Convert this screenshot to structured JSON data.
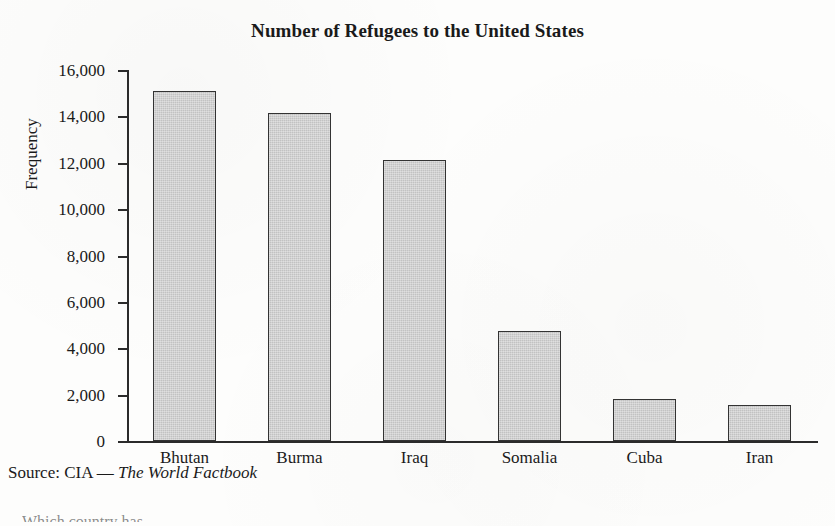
{
  "chart_data": {
    "type": "bar",
    "title": "Number of Refugees to the United States",
    "xlabel": "",
    "ylabel": "Frequency",
    "categories": [
      "Bhutan",
      "Burma",
      "Iraq",
      "Somalia",
      "Cuba",
      "Iran"
    ],
    "values": [
      15100,
      14150,
      12100,
      4750,
      1800,
      1550
    ],
    "ylim": [
      0,
      16000
    ],
    "ytick_values": [
      0,
      2000,
      4000,
      6000,
      8000,
      10000,
      12000,
      14000,
      16000
    ],
    "ytick_labels": [
      "0",
      "2,000",
      "4,000",
      "6,000",
      "8,000",
      "10,000",
      "12,000",
      "14,000",
      "16,000"
    ],
    "grid": false,
    "legend": "none",
    "bar_fill_color": "#c2c2c2",
    "bar_border_color": "#333333",
    "axis_color": "#2b2b2b"
  },
  "figure": {
    "source_prefix": "Source: CIA — ",
    "source_title": "The World Factbook"
  },
  "clipped": {
    "text": "Which country has..."
  }
}
